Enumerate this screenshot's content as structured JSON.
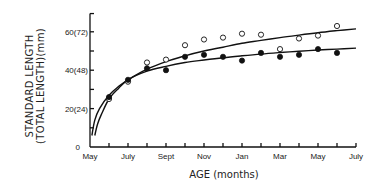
{
  "chart_data": {
    "type": "scatter",
    "title": "",
    "xlabel": "AGE (months)",
    "ylabel_line1": "STANDARD  LENGTH",
    "ylabel_line2": "(TOTAL LENGTH)(mm)",
    "x_tick_labels": [
      "May",
      "July",
      "Sept",
      "Nov",
      "Jan",
      "Mar",
      "May",
      "July"
    ],
    "x_tick_months": [
      0,
      2,
      4,
      6,
      8,
      10,
      12,
      14
    ],
    "x_minor_ticks": [
      1,
      2,
      3,
      4,
      5,
      6,
      7,
      8,
      9,
      10,
      11,
      12,
      13,
      14
    ],
    "xlim": [
      0,
      14
    ],
    "y_tick_labels": [
      "0",
      "20(24)",
      "40(48)",
      "60(72)"
    ],
    "y_tick_values": [
      0,
      20,
      40,
      60
    ],
    "y_minor_ticks": [
      10,
      30,
      50
    ],
    "ylim": [
      0,
      70
    ],
    "grid": false,
    "legend": "none",
    "series": [
      {
        "name": "open circles",
        "marker": "open-circle",
        "x": [
          1,
          2,
          3,
          4,
          5,
          6,
          7,
          8,
          9,
          10,
          11,
          12,
          13
        ],
        "y": [
          25,
          34,
          44,
          45.5,
          53,
          56,
          57,
          59,
          58.5,
          51,
          56.5,
          58,
          63
        ]
      },
      {
        "name": "filled circles",
        "marker": "filled-circle",
        "x": [
          1,
          2,
          3,
          4,
          5,
          6,
          7,
          8,
          9,
          10,
          11,
          12,
          13
        ],
        "y": [
          26,
          35,
          41,
          40,
          47,
          48,
          47,
          45,
          49,
          47,
          48,
          51,
          49
        ]
      }
    ],
    "fitted_curves": [
      {
        "name": "upper fit (open)",
        "x": [
          0.1,
          0.25,
          0.5,
          1,
          1.5,
          2,
          3,
          4,
          5,
          6,
          7,
          8,
          9,
          10,
          11,
          12,
          13,
          14
        ],
        "y": [
          6,
          14,
          20,
          27,
          31.5,
          35,
          40.5,
          44.5,
          47.5,
          50,
          52,
          54,
          55.5,
          57,
          58.3,
          59.5,
          60.6,
          61.5
        ]
      },
      {
        "name": "lower fit (filled)",
        "x": [
          0.25,
          0.4,
          0.6,
          1,
          1.5,
          2,
          3,
          4,
          5,
          6,
          7,
          8,
          9,
          10,
          11,
          12,
          13,
          14
        ],
        "y": [
          6,
          12,
          17,
          25,
          30.5,
          35,
          39.5,
          42,
          44,
          45.3,
          46.5,
          47.5,
          48.4,
          49.2,
          49.9,
          50.5,
          51,
          51.5
        ]
      }
    ]
  }
}
